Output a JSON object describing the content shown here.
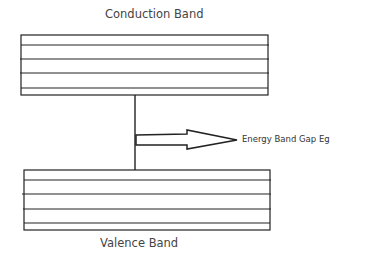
{
  "diagram": {
    "conduction_band": {
      "label": "Conduction Band",
      "inner_lines": 4
    },
    "valence_band": {
      "label": "Valence Band",
      "inner_lines": 4
    },
    "gap_arrow": {
      "label": "Energy Band Gap Eg",
      "direction": "right"
    }
  },
  "colors": {
    "line": "#222222",
    "text": "#444444",
    "background": "#ffffff"
  }
}
